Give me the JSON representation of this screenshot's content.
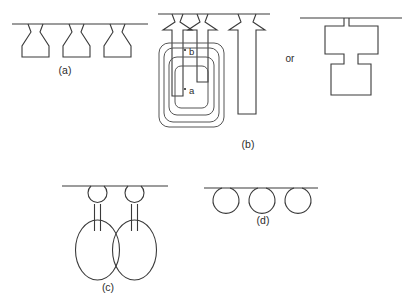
{
  "figure": {
    "title": "",
    "background_color": "#ffffff",
    "stroke_color": "#3a3a3a",
    "width": 416,
    "height": 302,
    "panels": [
      {
        "id": "a",
        "label": "(a)",
        "label_x": 65,
        "label_y": 74,
        "description": "three flask shapes hanging from a horizontal line"
      },
      {
        "id": "b",
        "label": "(b)",
        "label_x": 248,
        "label_y": 148,
        "description": "upward arrows over nested rounded rectangles, alternative form shown after 'or'"
      },
      {
        "id": "c",
        "label": "(c)",
        "label_x": 108,
        "label_y": 291,
        "description": "two balloon shapes with small head circle, thin neck and large oval body"
      },
      {
        "id": "d",
        "label": "(d)",
        "label_x": 263,
        "label_y": 224,
        "description": "three circles tangent to a horizontal line"
      }
    ],
    "inline_labels": [
      {
        "id": "b-marker",
        "text": "b",
        "x": 189,
        "y": 54
      },
      {
        "id": "a-marker",
        "text": "a",
        "x": 189,
        "y": 93
      }
    ],
    "connector_text": {
      "id": "or",
      "text": "or",
      "x": 290,
      "y": 62
    }
  }
}
